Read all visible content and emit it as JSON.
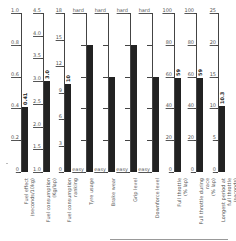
{
  "chart_data": {
    "type": "bar",
    "orientation": "vertical",
    "title": "",
    "columns": [
      {
        "label": "Fuel effect (seconds/10kg)",
        "min": "0",
        "max": "1.0",
        "ticks": [
          "0",
          "0.2",
          "0.4",
          "0.6",
          "0.8",
          "1.0"
        ],
        "value": 0.41,
        "value_label": "0.41",
        "range": [
          0,
          1.0
        ]
      },
      {
        "label": "Fuel consumption (Kg/lap)",
        "min": "1.0",
        "max": "4.5",
        "ticks": [
          "1.0",
          "1.5",
          "2.0",
          "2.5",
          "3.0",
          "3.5",
          "4.0",
          "4.5"
        ],
        "value": 3.0,
        "value_label": "3.0",
        "range": [
          1.0,
          4.5
        ]
      },
      {
        "label": "Fuel consumption ranking",
        "min": "0",
        "max": "18",
        "ticks": [
          "0",
          "3",
          "6",
          "9",
          "12",
          "15",
          "18"
        ],
        "value": 10,
        "value_label": "10",
        "range": [
          0,
          18
        ]
      },
      {
        "label": "Tyre usage",
        "min": "easy",
        "max": "hard",
        "ticks": [
          "easy",
          "",
          "",
          "",
          "",
          "hard"
        ],
        "value": 4,
        "value_label": "",
        "range": [
          0,
          5
        ]
      },
      {
        "label": "Brake wear",
        "min": "easy",
        "max": "hard",
        "ticks": [
          "easy",
          "",
          "",
          "",
          "",
          "hard"
        ],
        "value": 3,
        "value_label": "",
        "range": [
          0,
          5
        ]
      },
      {
        "label": "Grip level",
        "min": "easy",
        "max": "hard",
        "ticks": [
          "easy",
          "",
          "",
          "",
          "",
          "hard"
        ],
        "value": 4,
        "value_label": "",
        "range": [
          0,
          5
        ]
      },
      {
        "label": "Downforce level",
        "min": "easy",
        "max": "hard",
        "ticks": [
          "easy",
          "",
          "",
          "",
          "",
          "hard"
        ],
        "value": 3,
        "value_label": "",
        "range": [
          0,
          5
        ]
      },
      {
        "label": "Full throttle (% lap)",
        "min": "0",
        "max": "100",
        "ticks": [
          "0",
          "20",
          "40",
          "60",
          "80",
          "100"
        ],
        "value": 59,
        "value_label": "59",
        "range": [
          0,
          100
        ]
      },
      {
        "label": "Full throttle during race (% lap)",
        "min": "0",
        "max": "100",
        "ticks": [
          "0",
          "20",
          "40",
          "60",
          "80",
          "100"
        ],
        "value": 59,
        "value_label": "59",
        "range": [
          0,
          100
        ]
      },
      {
        "label": "Longest period at full throttle (seconds)",
        "min": "0",
        "max": "25",
        "ticks": [
          "0",
          "5",
          "10",
          "15",
          "20",
          "25"
        ],
        "value": 10.3,
        "value_label": "10.3",
        "range": [
          0,
          25
        ]
      }
    ],
    "grid": false,
    "legend": null
  },
  "labels": {
    "c0": "Fuel effect\n(seconds/10kg)",
    "c1": "Fuel consumption\n(Kg/lap)",
    "c2": "Fuel consumption\nranking",
    "c3": "Tyre usage",
    "c4": "Brake wear",
    "c5": "Grip level",
    "c6": "Downforce level",
    "c7": "Full throttle\n(% lap)",
    "c8": "Full throttle during\nrace\n(% lap)",
    "c9": "Longest period at\nfull throttle\n(seconds)"
  }
}
